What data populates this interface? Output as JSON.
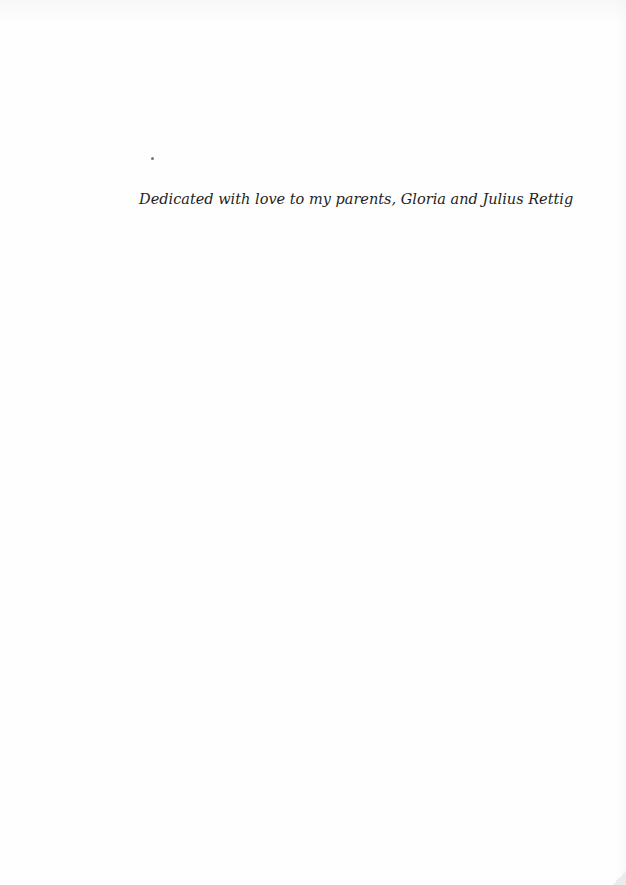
{
  "page": {
    "type": "dedication-page",
    "background_color": "#fefefe",
    "text_color": "#1e1e1e"
  },
  "dedication": {
    "text": "Dedicated with love to my parents, Gloria and Julius Rettig"
  }
}
